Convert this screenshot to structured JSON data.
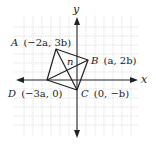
{
  "diagram": {
    "type": "coordinate-geometry",
    "axes": {
      "x_label": "x",
      "y_label": "y"
    },
    "points": [
      {
        "name": "A",
        "coords": "(−2a, 3b)",
        "label": "A (−2a, 3b)"
      },
      {
        "name": "B",
        "coords": "(a, 2b)",
        "label": "B (a, 2b)"
      },
      {
        "name": "C",
        "coords": "(0, −b)",
        "label": "C (0, −b)"
      },
      {
        "name": "D",
        "coords": "(−3a, 0)",
        "label": "D (−3a, 0)"
      }
    ],
    "intersection_label": "n",
    "segments": [
      "AB",
      "BC",
      "CD",
      "DA",
      "AC",
      "BD"
    ],
    "colors": {
      "grid": "#c8c8c8",
      "lines": "#222222",
      "background": "#ffffff"
    }
  }
}
